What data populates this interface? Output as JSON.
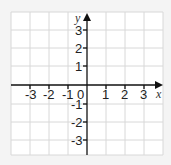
{
  "axes": {
    "x_label": "x",
    "y_label": "y",
    "origin_label": "0",
    "x_ticks": [
      "-3",
      "-2",
      "-1",
      "1",
      "2",
      "3"
    ],
    "y_ticks": [
      "3",
      "2",
      "1",
      "-1",
      "-2",
      "-3"
    ]
  },
  "colors": {
    "grid": "#d8d8d8",
    "axis": "#111111",
    "background": "#ffffff"
  }
}
